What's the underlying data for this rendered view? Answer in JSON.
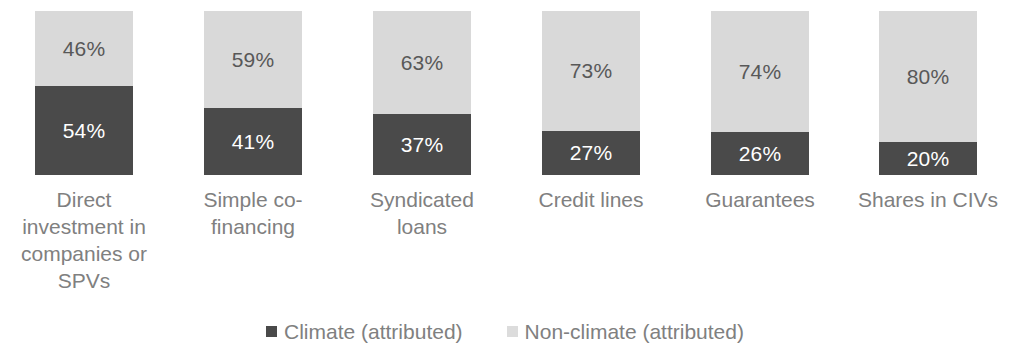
{
  "chart_data": {
    "type": "bar",
    "subtype": "100% stacked column",
    "title": "",
    "subtitle": "",
    "xlabel": "",
    "ylabel": "",
    "ylim": [
      0,
      100
    ],
    "grid": false,
    "legend_position": "bottom-center",
    "stacked": true,
    "value_suffix": "%",
    "categories": [
      "Direct investment in companies or SPVs",
      "Simple co-financing",
      "Syndicated loans",
      "Credit lines",
      "Guarantees",
      "Shares in CIVs"
    ],
    "category_label_lines": [
      "Direct\ninvestment in\ncompanies or\nSPVs",
      "Simple co-\nfinancing",
      "Syndicated\nloans",
      "Credit lines",
      "Guarantees",
      "Shares in CIVs"
    ],
    "series": [
      {
        "name": "Climate (attributed)",
        "color": "#4a4a4a",
        "values": [
          54,
          41,
          37,
          27,
          26,
          20
        ],
        "labels": [
          "54%",
          "41%",
          "37%",
          "27%",
          "26%",
          "20%"
        ]
      },
      {
        "name": "Non-climate (attributed)",
        "color": "#d9d9d9",
        "values": [
          46,
          59,
          63,
          73,
          74,
          80
        ],
        "labels": [
          "46%",
          "59%",
          "63%",
          "73%",
          "74%",
          "80%"
        ]
      }
    ],
    "legend": [
      {
        "label": "Climate (attributed)",
        "color": "#4a4a4a",
        "marker": "square"
      },
      {
        "label": "Non-climate (attributed)",
        "color": "#dcdcdc",
        "marker": "square"
      }
    ]
  },
  "colors": {
    "climate": "#4a4a4a",
    "non_climate": "#d9d9d9",
    "label_text": "#808080",
    "dark_segment_text": "#ffffff",
    "light_segment_text": "#585858",
    "background": "#ffffff"
  }
}
